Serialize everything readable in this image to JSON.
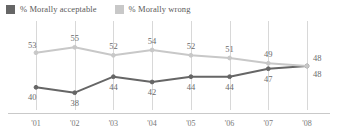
{
  "legend": {
    "entries": [
      {
        "label": "% Morally acceptable",
        "color": "#666666",
        "swatch_name": "legend-swatch-morally-acceptable"
      },
      {
        "label": "% Morally wrong",
        "color": "#c8c8c8",
        "swatch_name": "legend-swatch-morally-wrong"
      }
    ]
  },
  "chart_data": {
    "type": "line",
    "title": "",
    "subtitle": "",
    "xlabel": "",
    "ylabel": "",
    "ylim": [
      30,
      60
    ],
    "grid": true,
    "legend_position": "top-left",
    "categories": [
      "'01",
      "'02",
      "'03",
      "'04",
      "'05",
      "'06",
      "'07",
      "'08"
    ],
    "series": [
      {
        "name": "% Morally acceptable",
        "color": "#666666",
        "values": [
          40,
          38,
          44,
          42,
          44,
          44,
          47,
          48
        ],
        "label_positions": [
          "below",
          "below",
          "below",
          "below",
          "below",
          "below",
          "below",
          "below"
        ]
      },
      {
        "name": "% Morally wrong",
        "color": "#c8c8c8",
        "values": [
          53,
          55,
          52,
          54,
          52,
          51,
          49,
          48
        ],
        "label_positions": [
          "above",
          "above",
          "above",
          "above",
          "above",
          "above",
          "above",
          "above"
        ]
      }
    ]
  }
}
